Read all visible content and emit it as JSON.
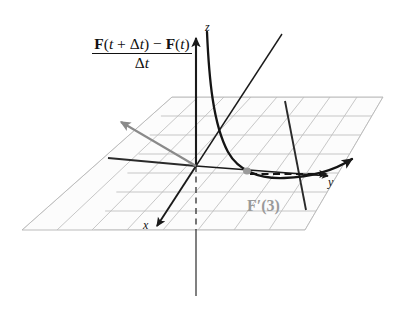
{
  "figure": {
    "title_formula": {
      "numerator_parts": [
        {
          "text": "F",
          "style": "bold"
        },
        {
          "text": "(",
          "style": "roman"
        },
        {
          "text": "t",
          "style": "italic"
        },
        {
          "text": " + ",
          "style": "roman"
        },
        {
          "text": "Δ",
          "style": "roman"
        },
        {
          "text": "t",
          "style": "italic"
        },
        {
          "text": ") − ",
          "style": "roman"
        },
        {
          "text": "F",
          "style": "bold"
        },
        {
          "text": "(",
          "style": "roman"
        },
        {
          "text": "t",
          "style": "italic"
        },
        {
          "text": ")",
          "style": "roman"
        }
      ],
      "numerator_text": "F(t + Δt) − F(t)",
      "denominator_text": "Δt"
    },
    "axis_labels": {
      "z": "z",
      "x": "x",
      "y": "y"
    },
    "derivative_label": "F′(3)",
    "colors": {
      "ink": "#1a1a1a",
      "grid": "#b9b9b9",
      "plane_fill": "#fbfbfb",
      "secant_vector": "#8a8a8a",
      "point_marker": "#9a9a9a",
      "derivative_label": "#9a9a9a",
      "background": "#ffffff"
    },
    "elements": [
      {
        "name": "coordinate-plane",
        "kind": "grid-parallelogram",
        "rows": 7,
        "cols": 8
      },
      {
        "name": "z-axis",
        "kind": "axis",
        "arrow": "up"
      },
      {
        "name": "x-axis",
        "kind": "axis",
        "arrow": "down-left"
      },
      {
        "name": "y-axis",
        "kind": "axis",
        "arrow": "right"
      },
      {
        "name": "space-curve",
        "kind": "curve"
      },
      {
        "name": "secant-vector",
        "kind": "arrow",
        "color": "#8a8a8a"
      },
      {
        "name": "difference-quotient-chord",
        "kind": "line"
      },
      {
        "name": "tangent-vector",
        "kind": "arrow"
      },
      {
        "name": "delta-vector-dashed",
        "kind": "dashed-arrow"
      },
      {
        "name": "point-of-tangency",
        "kind": "dot"
      }
    ]
  }
}
